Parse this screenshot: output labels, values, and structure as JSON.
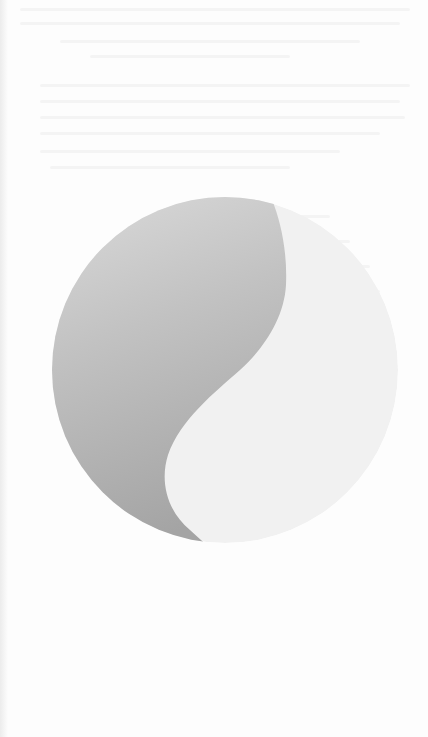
{
  "page": {
    "type": "scanned-page",
    "background": "#fdfdfd",
    "text_legible": false
  },
  "graphic": {
    "name": "yin-yang-circle",
    "center": [
      225,
      370
    ],
    "radius": 173,
    "colors": {
      "dark_top": "#dddddd",
      "dark_mid": "#c2c2c2",
      "dark_bottom": "#a4a4a4",
      "light_half": "#f1f1f1"
    }
  },
  "ghost_lines": [
    {
      "x": 20,
      "y": 8,
      "w": 390
    },
    {
      "x": 20,
      "y": 22,
      "w": 380
    },
    {
      "x": 60,
      "y": 40,
      "w": 300
    },
    {
      "x": 90,
      "y": 55,
      "w": 200
    },
    {
      "x": 40,
      "y": 84,
      "w": 370
    },
    {
      "x": 40,
      "y": 100,
      "w": 360
    },
    {
      "x": 40,
      "y": 116,
      "w": 365
    },
    {
      "x": 40,
      "y": 132,
      "w": 340
    },
    {
      "x": 40,
      "y": 150,
      "w": 300
    },
    {
      "x": 50,
      "y": 166,
      "w": 240
    },
    {
      "x": 200,
      "y": 215,
      "w": 130
    },
    {
      "x": 210,
      "y": 240,
      "w": 140
    },
    {
      "x": 220,
      "y": 265,
      "w": 150
    },
    {
      "x": 230,
      "y": 290,
      "w": 150
    },
    {
      "x": 235,
      "y": 315,
      "w": 150
    },
    {
      "x": 235,
      "y": 340,
      "w": 155
    },
    {
      "x": 225,
      "y": 365,
      "w": 160
    },
    {
      "x": 215,
      "y": 390,
      "w": 170
    },
    {
      "x": 200,
      "y": 415,
      "w": 180
    },
    {
      "x": 190,
      "y": 440,
      "w": 175
    },
    {
      "x": 185,
      "y": 465,
      "w": 165
    },
    {
      "x": 190,
      "y": 490,
      "w": 140
    }
  ]
}
